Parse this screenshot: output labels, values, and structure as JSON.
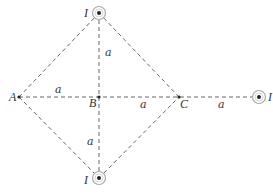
{
  "diagram": {
    "points": {
      "A": {
        "label": "A",
        "x": 19,
        "y": 97
      },
      "B": {
        "label": "B",
        "x": 99,
        "y": 97
      },
      "C": {
        "label": "C",
        "x": 179,
        "y": 97
      }
    },
    "wires": [
      {
        "name": "top",
        "label": "I",
        "x": 99,
        "y": 13,
        "direction": "out-of-page"
      },
      {
        "name": "bottom",
        "label": "I",
        "x": 99,
        "y": 178,
        "direction": "out-of-page"
      },
      {
        "name": "right",
        "label": "I",
        "x": 259,
        "y": 97,
        "direction": "out-of-page"
      }
    ],
    "distance_labels": {
      "top_vertical": "a",
      "bottom_vertical": "a",
      "A_to_B": "a",
      "B_to_C": "a",
      "C_to_right": "a"
    },
    "colors": {
      "line": "#555555",
      "wire_ring": "#aaaaaa",
      "dot": "#222222"
    }
  }
}
